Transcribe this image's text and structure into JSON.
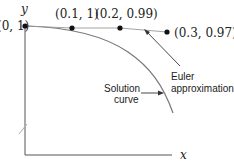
{
  "diagram": {
    "axes": {
      "x_label": "x",
      "y_label": "y"
    },
    "points": [
      {
        "label": "(0, 1)",
        "x": 0.0,
        "y": 1.0
      },
      {
        "label": "(0.1, 1)",
        "x": 0.1,
        "y": 1.0
      },
      {
        "label": "(0.2, 0.99)",
        "x": 0.2,
        "y": 0.99
      },
      {
        "label": "(0.3, 0.97)",
        "x": 0.3,
        "y": 0.97
      }
    ],
    "annotations": {
      "euler_line1": "Euler",
      "euler_line2": "approximation",
      "solution_line1": "Solution",
      "solution_line2": "curve"
    },
    "colors": {
      "axis": "#555555",
      "curve": "#777777",
      "euler_line": "#999999",
      "point": "#111111",
      "text": "#222222"
    }
  }
}
